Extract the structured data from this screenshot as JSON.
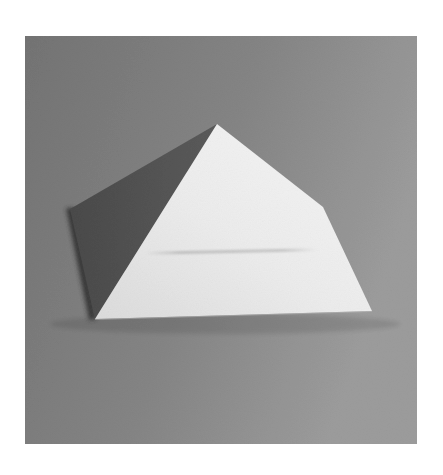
{
  "image": {
    "subject": "white paper pyramid on gray surface",
    "style": "grayscale photograph"
  },
  "palette": {
    "background_dark": "#747474",
    "background_mid": "#858585",
    "background_light": "#9c9c9c",
    "shaded_face": "#5b5b5b",
    "shaded_face_dark": "#4a4a4a",
    "lit_face_light": "#f6f6f6",
    "lit_face_mid": "#ececec",
    "lit_face_dark": "#dcdcdc",
    "edge_shadow": "#2e2e2e",
    "crease": "#b8b8b8"
  },
  "objects": [
    {
      "name": "pyramid-lit-face",
      "role": "front face of pyramid, brightly lit"
    },
    {
      "name": "pyramid-shaded-face",
      "role": "left face of pyramid, in shadow"
    },
    {
      "name": "pyramid-edge-shadow",
      "role": "thin cast shadow along left base"
    },
    {
      "name": "pyramid-crease",
      "role": "faint fold line across front face"
    }
  ]
}
